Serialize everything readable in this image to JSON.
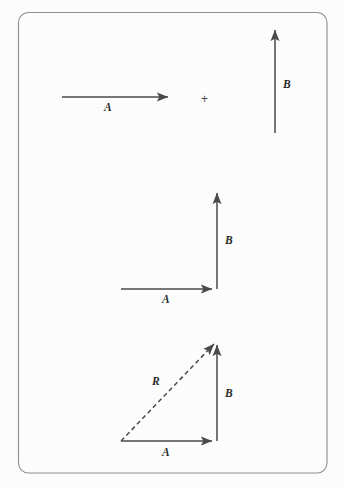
{
  "figure": {
    "background_color": "#fcfcfc",
    "frame_color": "#8d8d8d",
    "stroke_color": "#4a4a4a",
    "width": 344,
    "height": 487
  },
  "panels": [
    {
      "id": "panel-operands",
      "operator": "+",
      "vectors": [
        {
          "name": "A",
          "label": "A",
          "style": "solid",
          "orientation": "horizontal-right"
        },
        {
          "name": "B",
          "label": "B",
          "style": "solid",
          "orientation": "vertical-up"
        }
      ]
    },
    {
      "id": "panel-tip-to-tail",
      "vectors": [
        {
          "name": "A",
          "label": "A",
          "style": "solid",
          "orientation": "horizontal-right"
        },
        {
          "name": "B",
          "label": "B",
          "style": "solid",
          "orientation": "vertical-up"
        }
      ]
    },
    {
      "id": "panel-resultant",
      "vectors": [
        {
          "name": "A",
          "label": "A",
          "style": "solid",
          "orientation": "horizontal-right"
        },
        {
          "name": "B",
          "label": "B",
          "style": "solid",
          "orientation": "vertical-up"
        },
        {
          "name": "R",
          "label": "R",
          "style": "dashed",
          "orientation": "diagonal-up-right"
        }
      ]
    }
  ],
  "labels": {
    "panel1_a": "A",
    "panel1_b": "B",
    "panel1_operator": "+",
    "panel2_a": "A",
    "panel2_b": "B",
    "panel3_a": "A",
    "panel3_b": "B",
    "panel3_r": "R"
  }
}
